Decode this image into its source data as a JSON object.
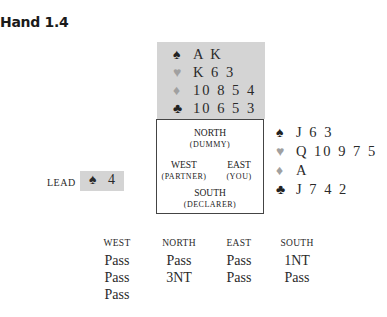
{
  "title": "Hand 1.4",
  "north": {
    "spades": "A K",
    "hearts": "K 6 3",
    "diamonds": "10 8 5 4",
    "clubs": "10 6 5 3"
  },
  "east": {
    "spades": "J 6 3",
    "hearts": "Q 10 9 7 5",
    "diamonds": "A",
    "clubs": "J 7 4 2"
  },
  "compass": {
    "north": "NORTH",
    "north_role": "(DUMMY)",
    "west": "WEST",
    "west_role": "(PARTNER)",
    "east": "EAST",
    "east_role": "(YOU)",
    "south": "SOUTH",
    "south_role": "(DECLARER)"
  },
  "lead": {
    "label": "LEAD",
    "suit": "♠",
    "card": "4"
  },
  "suits": {
    "spades": "♠",
    "hearts": "♥",
    "diamonds": "♦",
    "clubs": "♣"
  },
  "bidding": {
    "headers": [
      "WEST",
      "NORTH",
      "EAST",
      "SOUTH"
    ],
    "columns": [
      [
        "Pass",
        "Pass",
        "Pass"
      ],
      [
        "Pass",
        "3NT"
      ],
      [
        "Pass",
        "Pass"
      ],
      [
        "1NT",
        "Pass"
      ]
    ]
  }
}
